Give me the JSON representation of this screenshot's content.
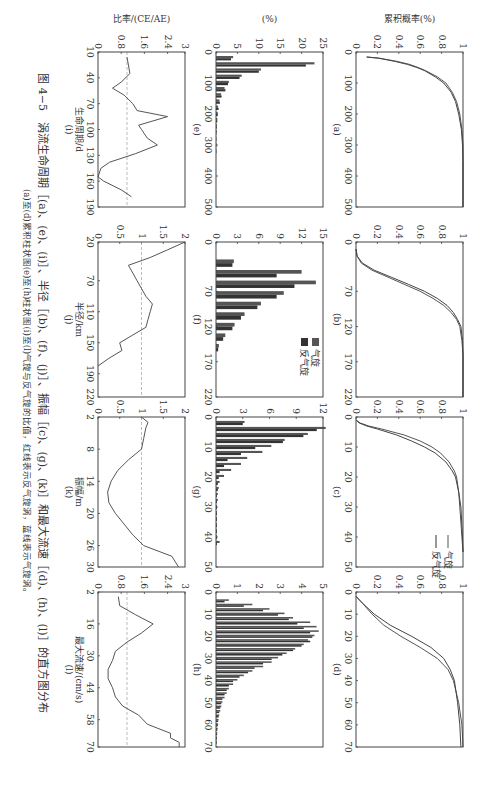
{
  "caption": {
    "line1": "图 4−5　涡流生命周期［(a)、(e)、(i)］、半径［(b)、(f)、(j)］、振幅［(c)、(g)、(k)］和最大流速［(d)、(h)、(l)］的直方图分布",
    "line2": "(a)至(d)累积柱状图(e)至(h)柱状图(i)至(l)气旋与反气旋的比值，红线表示反气旋涡，蓝线表示气旋涡。"
  },
  "legend": {
    "cyclone": "气旋",
    "anticyclone": "反气旋"
  },
  "axis_labels": {
    "cum_ylabel": "累积概率(%)",
    "hist_ylabel": "(%)",
    "ratio_ylabel": "比率/(CE/AE)",
    "i_xlabel": "生命周期/d",
    "j_xlabel": "半径/km",
    "k_xlabel": "振幅/m",
    "l_xlabel": "最大流速/(cm/s)"
  },
  "panel_labels": [
    "(a)",
    "(b)",
    "(c)",
    "(d)",
    "(e)",
    "(f)",
    "(g)",
    "(h)",
    "(i)",
    "(j)",
    "(k)",
    "(l)"
  ],
  "chart_data": [
    {
      "id": "a",
      "type": "line",
      "title": "(a)",
      "xlabel": "",
      "ylabel": "累积概率(%)",
      "xlim": [
        0,
        500
      ],
      "ylim": [
        0,
        1
      ],
      "xticks": [
        0,
        100,
        200,
        300,
        400,
        500
      ],
      "yticks": [
        0,
        0.2,
        0.4,
        0.6,
        0.8,
        1
      ],
      "series": [
        {
          "name": "气旋",
          "x": [
            16,
            20,
            30,
            40,
            50,
            60,
            80,
            100,
            130,
            160,
            200,
            250,
            300,
            350,
            400,
            500
          ],
          "y": [
            0.1,
            0.22,
            0.38,
            0.5,
            0.58,
            0.65,
            0.76,
            0.84,
            0.9,
            0.94,
            0.97,
            0.99,
            1,
            1,
            1,
            1
          ]
        },
        {
          "name": "反气旋",
          "x": [
            16,
            20,
            30,
            40,
            50,
            60,
            80,
            100,
            130,
            160,
            200,
            250,
            300,
            350,
            400,
            500
          ],
          "y": [
            0.1,
            0.21,
            0.36,
            0.48,
            0.57,
            0.64,
            0.74,
            0.82,
            0.89,
            0.93,
            0.96,
            0.985,
            0.995,
            1,
            1,
            1
          ]
        }
      ]
    },
    {
      "id": "b",
      "type": "line",
      "title": "(b)",
      "xlim": [
        0,
        220
      ],
      "ylim": [
        0,
        1
      ],
      "xticks": [
        0,
        70,
        120,
        170,
        220
      ],
      "yticks": [
        0,
        0.2,
        0.4,
        0.6,
        0.8,
        1
      ],
      "series": [
        {
          "name": "气旋",
          "x": [
            10,
            20,
            30,
            40,
            50,
            60,
            70,
            80,
            90,
            100,
            110,
            120,
            140,
            160,
            220
          ],
          "y": [
            0,
            0.01,
            0.05,
            0.15,
            0.3,
            0.45,
            0.6,
            0.72,
            0.82,
            0.89,
            0.94,
            0.97,
            0.99,
            1,
            1
          ]
        },
        {
          "name": "反气旋",
          "x": [
            10,
            20,
            30,
            40,
            50,
            60,
            70,
            80,
            90,
            100,
            110,
            120,
            140,
            160,
            220
          ],
          "y": [
            0,
            0.01,
            0.06,
            0.17,
            0.33,
            0.49,
            0.64,
            0.76,
            0.85,
            0.91,
            0.95,
            0.98,
            0.995,
            1,
            1
          ]
        }
      ]
    },
    {
      "id": "c",
      "type": "line",
      "title": "(c)",
      "xlim": [
        0,
        50
      ],
      "ylim": [
        0,
        1
      ],
      "xticks": [
        0,
        10,
        20,
        30,
        40,
        50
      ],
      "yticks": [
        0,
        0.2,
        0.4,
        0.6,
        0.8,
        1
      ],
      "series": [
        {
          "name": "气旋",
          "x": [
            1,
            2,
            3,
            4,
            6,
            8,
            10,
            12,
            15,
            18,
            20,
            25,
            30,
            40,
            45
          ],
          "y": [
            0,
            0.04,
            0.12,
            0.24,
            0.45,
            0.6,
            0.71,
            0.79,
            0.87,
            0.92,
            0.94,
            0.96,
            0.97,
            0.99,
            1
          ]
        },
        {
          "name": "反气旋",
          "x": [
            1,
            2,
            3,
            4,
            6,
            8,
            10,
            12,
            15,
            18,
            20,
            25,
            30,
            40,
            45
          ],
          "y": [
            0,
            0.03,
            0.1,
            0.2,
            0.38,
            0.52,
            0.64,
            0.74,
            0.84,
            0.9,
            0.93,
            0.96,
            0.98,
            0.995,
            1
          ]
        }
      ]
    },
    {
      "id": "d",
      "type": "line",
      "title": "(d)",
      "xlim": [
        0,
        70
      ],
      "ylim": [
        0,
        1
      ],
      "xticks": [
        0,
        10,
        20,
        30,
        40,
        50,
        60,
        70
      ],
      "yticks": [
        0,
        0.2,
        0.4,
        0.6,
        0.8,
        1
      ],
      "series": [
        {
          "name": "气旋",
          "x": [
            2,
            5,
            10,
            15,
            20,
            25,
            30,
            35,
            40,
            50,
            60,
            70
          ],
          "y": [
            0,
            0.06,
            0.15,
            0.26,
            0.42,
            0.6,
            0.76,
            0.86,
            0.91,
            0.96,
            0.99,
            1
          ]
        },
        {
          "name": "反气旋",
          "x": [
            2,
            5,
            10,
            15,
            20,
            25,
            30,
            35,
            40,
            50,
            60,
            70
          ],
          "y": [
            0,
            0.06,
            0.17,
            0.32,
            0.52,
            0.7,
            0.82,
            0.88,
            0.92,
            0.95,
            0.97,
            0.98
          ]
        }
      ]
    },
    {
      "id": "e",
      "type": "bar",
      "title": "(e)",
      "ylabel": "(%)",
      "xlim": [
        0,
        500
      ],
      "ylim": [
        0,
        25
      ],
      "xticks": [
        0,
        100,
        200,
        300,
        400,
        500
      ],
      "yticks": [
        0,
        5,
        10,
        15,
        20,
        25
      ],
      "categories": [
        20,
        40,
        60,
        80,
        100,
        120,
        140,
        160,
        180,
        200,
        220,
        240,
        260,
        280,
        300,
        320
      ],
      "series": [
        {
          "name": "气旋",
          "values": [
            4,
            23,
            10.5,
            6,
            3,
            2,
            1.2,
            0.8,
            0.5,
            0.4,
            0.3,
            0.2,
            0.2,
            0.1,
            0.1,
            0.1
          ]
        },
        {
          "name": "反气旋",
          "values": [
            3.5,
            21,
            10,
            5.5,
            2.8,
            2.2,
            1.3,
            0.9,
            0.6,
            0.4,
            0.3,
            0.2,
            0.1,
            0.1,
            0.1,
            0.1
          ]
        }
      ]
    },
    {
      "id": "f",
      "type": "bar",
      "title": "(f)",
      "xlim": [
        0,
        220
      ],
      "ylim": [
        0,
        15
      ],
      "xticks": [
        0,
        70,
        120,
        170,
        220
      ],
      "yticks": [
        0,
        3,
        6,
        9,
        12,
        15
      ],
      "categories": [
        30,
        45,
        60,
        75,
        90,
        105,
        120,
        135,
        150
      ],
      "series": [
        {
          "name": "气旋",
          "values": [
            2.5,
            12,
            14,
            9.5,
            6.3,
            4,
            2.6,
            1.3,
            0.4
          ]
        },
        {
          "name": "反气旋",
          "values": [
            2.3,
            8.5,
            11,
            8.5,
            5.8,
            3.5,
            2.3,
            1.0,
            0.3
          ]
        }
      ]
    },
    {
      "id": "g",
      "type": "bar",
      "title": "(g)",
      "xlim": [
        0,
        50
      ],
      "ylim": [
        0,
        12
      ],
      "xticks": [
        0,
        10,
        20,
        30,
        40,
        50
      ],
      "yticks": [
        0,
        3,
        6,
        9,
        12
      ],
      "categories": [
        2,
        4,
        6,
        8,
        10,
        12,
        14,
        16,
        18,
        20,
        22,
        24,
        26,
        28,
        30,
        32,
        34,
        36,
        38,
        40,
        42
      ],
      "series": [
        {
          "name": "气旋",
          "values": [
            3.2,
            12.3,
            10.3,
            7.7,
            6.2,
            5.2,
            3.5,
            2.8,
            1.7,
            0.9,
            0.4,
            0.3,
            0.2,
            0.2,
            0.1,
            0.1,
            0.1,
            0.1,
            0.1,
            0.1,
            0.4
          ]
        },
        {
          "name": "反气旋",
          "values": [
            3.0,
            11.3,
            9.8,
            7.5,
            4.4,
            2.8,
            1.3,
            0.9,
            0.4,
            0.3,
            0.2,
            0.2,
            0.1,
            0.1,
            0.1,
            0.1,
            0.1,
            0.1,
            0.1,
            0.1,
            0.1
          ]
        }
      ]
    },
    {
      "id": "h",
      "type": "bar",
      "title": "(h)",
      "xlim": [
        0,
        70
      ],
      "ylim": [
        0,
        5
      ],
      "xticks": [
        0,
        10,
        20,
        30,
        40,
        50,
        60,
        70
      ],
      "yticks": [
        0,
        1,
        2,
        3,
        4,
        5
      ],
      "categories": [
        4,
        6,
        8,
        10,
        12,
        14,
        16,
        18,
        20,
        22,
        24,
        26,
        28,
        30,
        32,
        34,
        36,
        38,
        40,
        42,
        44,
        46,
        48,
        50,
        52,
        54,
        56,
        58,
        60,
        62,
        64,
        66,
        68
      ],
      "series": [
        {
          "name": "气旋",
          "values": [
            0.6,
            1.7,
            2.5,
            3.2,
            3.6,
            4.4,
            4.7,
            4.8,
            4.6,
            4.3,
            4.1,
            3.7,
            3.3,
            2.9,
            2.6,
            2.2,
            1.7,
            1.3,
            1.0,
            0.8,
            0.6,
            0.5,
            0.4,
            0.3,
            0.25,
            0.2,
            0.15,
            0.12,
            0.1,
            0.08,
            0.06,
            0.05,
            0.04
          ]
        },
        {
          "name": "反气旋",
          "values": [
            0.4,
            1.3,
            2.2,
            2.9,
            3.4,
            3.8,
            4.1,
            4.4,
            4.5,
            4.4,
            4.0,
            3.6,
            3.1,
            2.6,
            2.2,
            1.8,
            1.5,
            1.1,
            0.8,
            0.6,
            0.5,
            0.4,
            0.3,
            0.25,
            0.2,
            0.15,
            0.12,
            0.1,
            0.08,
            0.06,
            0.05,
            0.04,
            0.03
          ]
        }
      ]
    },
    {
      "id": "i",
      "type": "line",
      "title": "(i)",
      "xlabel": "生命周期/d",
      "ylabel": "比率/(CE/AE)",
      "xlim": [
        10,
        190
      ],
      "ylim": [
        0,
        3
      ],
      "xticks": [
        10,
        40,
        70,
        100,
        130,
        160,
        190
      ],
      "yticks": [
        0,
        0.8,
        1.6,
        2.4,
        3
      ],
      "reference_line": 1,
      "x": [
        16,
        25,
        35,
        45,
        52,
        60,
        70,
        78,
        85,
        95,
        100,
        110,
        118,
        128,
        138,
        145,
        155,
        160,
        170,
        178
      ],
      "y": [
        1.0,
        1.05,
        1.1,
        0.8,
        0.5,
        0.9,
        1.2,
        1.35,
        2.4,
        1.4,
        1.5,
        1.7,
        2.05,
        1.3,
        0.4,
        0.1,
        0.0,
        0.2,
        0.8,
        1.15
      ]
    },
    {
      "id": "j",
      "type": "line",
      "title": "(j)",
      "xlabel": "半径/km",
      "xlim": [
        20,
        220
      ],
      "ylim": [
        0,
        2
      ],
      "xticks": [
        20,
        70,
        110,
        150,
        190,
        220
      ],
      "yticks": [
        0,
        0.5,
        1,
        1.5,
        2
      ],
      "reference_line": 1,
      "x": [
        20,
        30,
        40,
        50,
        60,
        70,
        80,
        90,
        100,
        110,
        120,
        130,
        140,
        150,
        160,
        170,
        180
      ],
      "y": [
        2.0,
        1.6,
        1.2,
        0.7,
        0.8,
        0.9,
        1.0,
        1.1,
        1.25,
        1.2,
        1.15,
        1.1,
        0.8,
        0.5,
        0.55,
        0.25,
        0.0
      ]
    },
    {
      "id": "k",
      "type": "line",
      "title": "(k)",
      "xlabel": "振幅/m",
      "xlim": [
        2,
        30
      ],
      "ylim": [
        0,
        2
      ],
      "xticks": [
        2,
        8,
        14,
        20,
        26,
        30
      ],
      "yticks": [
        0,
        0.5,
        1,
        1.5,
        2
      ],
      "reference_line": 1,
      "x": [
        2,
        3,
        4,
        6,
        8,
        10,
        12,
        14,
        16,
        18,
        20,
        22,
        24,
        26,
        28,
        30
      ],
      "y": [
        1.0,
        1.15,
        1.1,
        1.05,
        1.0,
        0.7,
        0.45,
        0.3,
        0.22,
        0.25,
        0.4,
        0.6,
        0.8,
        1.05,
        1.7,
        1.85
      ]
    },
    {
      "id": "l",
      "type": "line",
      "title": "(l)",
      "xlabel": "最大流速/(cm/s)",
      "xlim": [
        2,
        70
      ],
      "ylim": [
        0,
        3
      ],
      "xticks": [
        2,
        16,
        30,
        44,
        58,
        70
      ],
      "yticks": [
        0,
        0.8,
        1.6,
        2.4,
        3
      ],
      "reference_line": 1,
      "x": [
        4,
        8,
        12,
        16,
        20,
        24,
        28,
        32,
        36,
        40,
        44,
        48,
        52,
        56,
        60,
        64,
        66,
        68,
        70
      ],
      "y": [
        0.7,
        0.75,
        1.3,
        1.9,
        1.5,
        1.0,
        0.6,
        0.5,
        0.35,
        0.35,
        0.5,
        0.6,
        0.85,
        1.4,
        1.7,
        2.5,
        2.5,
        2.8,
        2.8
      ]
    }
  ]
}
